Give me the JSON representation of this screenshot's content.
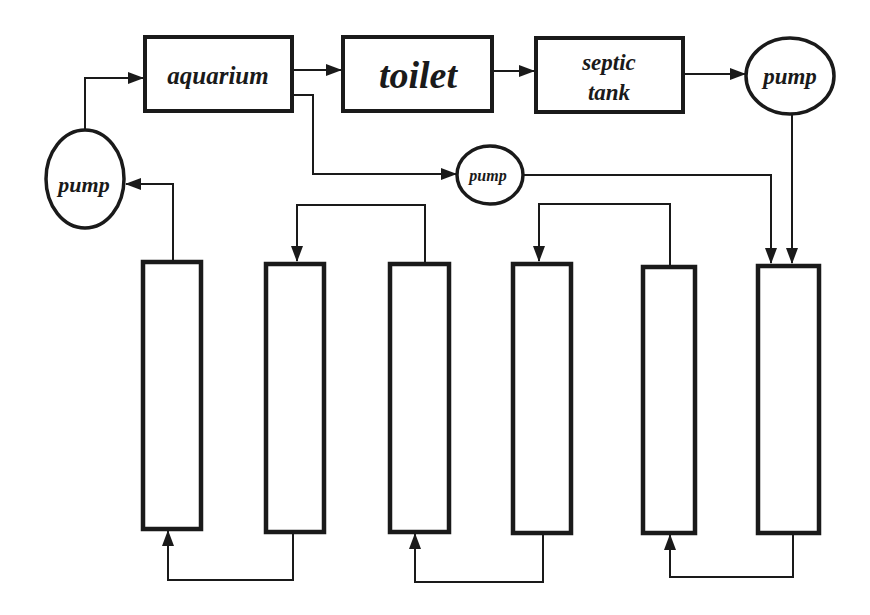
{
  "diagram": {
    "nodes": {
      "aquarium": {
        "label": "aquarium"
      },
      "toilet": {
        "label": "toilet"
      },
      "septic_tank": {
        "line1": "septic",
        "line2": "tank"
      },
      "pump_left": {
        "label": "pump"
      },
      "pump_right": {
        "label": "pump"
      },
      "pump_middle": {
        "label": "pump"
      }
    },
    "columns": [
      {
        "id": "column-1"
      },
      {
        "id": "column-2"
      },
      {
        "id": "column-3"
      },
      {
        "id": "column-4"
      },
      {
        "id": "column-5"
      },
      {
        "id": "column-6"
      }
    ],
    "edges": [
      {
        "from": "pump_left",
        "to": "aquarium"
      },
      {
        "from": "aquarium",
        "to": "toilet"
      },
      {
        "from": "toilet",
        "to": "septic_tank"
      },
      {
        "from": "septic_tank",
        "to": "pump_right"
      },
      {
        "from": "pump_right",
        "to": "column-6"
      },
      {
        "from": "aquarium",
        "to": "pump_middle"
      },
      {
        "from": "pump_middle",
        "to": "column-6"
      },
      {
        "from": "column-1",
        "to": "pump_left"
      },
      {
        "from": "column-3",
        "to": "column-2"
      },
      {
        "from": "column-5",
        "to": "column-4"
      },
      {
        "from": "column-2",
        "to": "column-1"
      },
      {
        "from": "column-4",
        "to": "column-3"
      },
      {
        "from": "column-6",
        "to": "column-5"
      }
    ],
    "colors": {
      "stroke": "#1a1a1a",
      "background": "#ffffff"
    }
  }
}
